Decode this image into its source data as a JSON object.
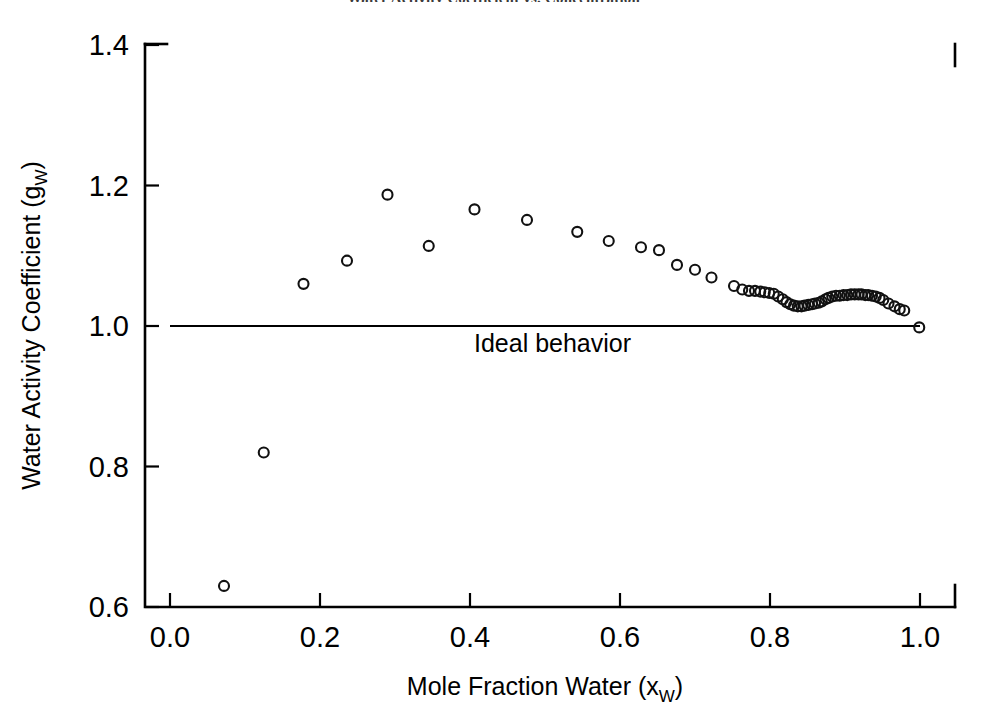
{
  "figure": {
    "clipped_title": "Water Activity Coefficient vs. Concentration",
    "background_color": "#ffffff",
    "marker_color": "#111111",
    "axis_color": "#000000"
  },
  "chart_data": {
    "type": "scatter",
    "title": "",
    "xlabel_text": "Mole Fraction Water (x",
    "xlabel_sub": "W",
    "xlabel_close": ")",
    "ylabel_text": "Water Activity Coefficient (g",
    "ylabel_sub": "W",
    "ylabel_close": ")",
    "xlim": [
      0.0,
      1.0
    ],
    "ylim": [
      0.6,
      1.4
    ],
    "xticks": [
      0.0,
      0.2,
      0.4,
      0.6,
      0.8,
      1.0
    ],
    "xtick_labels": [
      "0.0",
      "0.2",
      "0.4",
      "0.6",
      "0.8",
      "1.0"
    ],
    "yticks": [
      0.6,
      0.8,
      1.0,
      1.2,
      1.4
    ],
    "ytick_labels": [
      "0.6",
      "0.8",
      "1.0",
      "1.2",
      "1.4"
    ],
    "grid": false,
    "legend": null,
    "marker": "open-circle",
    "marker_size": 5,
    "annotations": [
      {
        "text": "Ideal behavior",
        "x": 0.51,
        "y": 0.963,
        "name": "ideal-behavior-label"
      }
    ],
    "reference_lines": [
      {
        "name": "ideal-behavior-line",
        "orientation": "horizontal",
        "y": 1.0,
        "x_start": 0.0,
        "x_end": 1.0
      }
    ],
    "series": [
      {
        "name": "Water activity coefficient",
        "points": [
          [
            0.072,
            0.63
          ],
          [
            0.125,
            0.82
          ],
          [
            0.178,
            1.06
          ],
          [
            0.236,
            1.093
          ],
          [
            0.29,
            1.187
          ],
          [
            0.345,
            1.114
          ],
          [
            0.406,
            1.166
          ],
          [
            0.476,
            1.151
          ],
          [
            0.543,
            1.134
          ],
          [
            0.585,
            1.121
          ],
          [
            0.628,
            1.112
          ],
          [
            0.652,
            1.108
          ],
          [
            0.676,
            1.087
          ],
          [
            0.7,
            1.08
          ],
          [
            0.722,
            1.069
          ],
          [
            0.752,
            1.057
          ],
          [
            0.763,
            1.052
          ],
          [
            0.772,
            1.05
          ],
          [
            0.78,
            1.05
          ],
          [
            0.787,
            1.049
          ],
          [
            0.793,
            1.048
          ],
          [
            0.799,
            1.047
          ],
          [
            0.805,
            1.046
          ],
          [
            0.811,
            1.042
          ],
          [
            0.817,
            1.038
          ],
          [
            0.822,
            1.034
          ],
          [
            0.827,
            1.031
          ],
          [
            0.832,
            1.029
          ],
          [
            0.837,
            1.028
          ],
          [
            0.842,
            1.028
          ],
          [
            0.846,
            1.029
          ],
          [
            0.851,
            1.03
          ],
          [
            0.856,
            1.031
          ],
          [
            0.86,
            1.032
          ],
          [
            0.865,
            1.033
          ],
          [
            0.869,
            1.035
          ],
          [
            0.874,
            1.038
          ],
          [
            0.878,
            1.04
          ],
          [
            0.883,
            1.042
          ],
          [
            0.888,
            1.043
          ],
          [
            0.893,
            1.043
          ],
          [
            0.898,
            1.044
          ],
          [
            0.903,
            1.044
          ],
          [
            0.908,
            1.045
          ],
          [
            0.913,
            1.045
          ],
          [
            0.918,
            1.045
          ],
          [
            0.922,
            1.045
          ],
          [
            0.927,
            1.044
          ],
          [
            0.931,
            1.044
          ],
          [
            0.936,
            1.043
          ],
          [
            0.941,
            1.042
          ],
          [
            0.946,
            1.04
          ],
          [
            0.951,
            1.037
          ],
          [
            0.958,
            1.032
          ],
          [
            0.966,
            1.028
          ],
          [
            0.973,
            1.024
          ],
          [
            0.979,
            1.022
          ],
          [
            0.999,
            0.998
          ]
        ]
      }
    ]
  }
}
